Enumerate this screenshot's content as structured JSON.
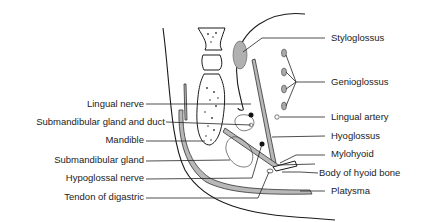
{
  "diagram": {
    "type": "anatomical cross-section",
    "labels_left": [
      {
        "id": "lingual-nerve",
        "text": "Lingual nerve",
        "y": 104
      },
      {
        "id": "submandibular-gland-and-duct",
        "text": "Submandibular gland and duct",
        "y": 122
      },
      {
        "id": "mandible",
        "text": "Mandible",
        "y": 139
      },
      {
        "id": "submandibular-gland",
        "text": "Submandibular gland",
        "y": 160
      },
      {
        "id": "hypoglossal-nerve",
        "text": "Hypoglossal nerve",
        "y": 178
      },
      {
        "id": "tendon-of-digastric",
        "text": "Tendon of digastric",
        "y": 197
      }
    ],
    "labels_right": [
      {
        "id": "styloglossus",
        "text": "Styloglossus",
        "y": 38
      },
      {
        "id": "genioglossus",
        "text": "Genioglossus",
        "y": 82
      },
      {
        "id": "lingual-artery",
        "text": "Lingual artery",
        "y": 117
      },
      {
        "id": "hyoglossus",
        "text": "Hyoglossus",
        "y": 136
      },
      {
        "id": "mylohyoid",
        "text": "Mylohyoid",
        "y": 154
      },
      {
        "id": "body-of-hyoid-bone",
        "text": "Body of hyoid bone",
        "y": 173
      },
      {
        "id": "platysma",
        "text": "Platysma",
        "y": 191
      }
    ],
    "colors": {
      "ink": "#222222",
      "muscle_fill": "#b8b8b8",
      "background": "#ffffff"
    }
  }
}
